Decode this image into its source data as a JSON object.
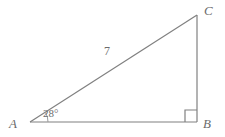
{
  "figure": {
    "type": "right-triangle-diagram",
    "background_color": "#ffffff",
    "stroke_color": "#808080",
    "text_color": "#6b6b6b",
    "vertices": {
      "A": {
        "label": "A",
        "x": 30,
        "y": 122
      },
      "B": {
        "label": "B",
        "x": 197,
        "y": 122
      },
      "C": {
        "label": "C",
        "x": 197,
        "y": 15
      }
    },
    "sides": {
      "hypotenuse": {
        "from": "A",
        "to": "C",
        "label": "7"
      },
      "base": {
        "from": "A",
        "to": "B",
        "label": ""
      },
      "vertical": {
        "from": "C",
        "to": "B",
        "label": ""
      }
    },
    "angles": {
      "at_A": {
        "label": "28°",
        "value": 28,
        "unit": "degrees",
        "marker": "arc"
      },
      "at_B": {
        "label": "",
        "value": 90,
        "unit": "degrees",
        "marker": "right-angle-square"
      }
    }
  }
}
